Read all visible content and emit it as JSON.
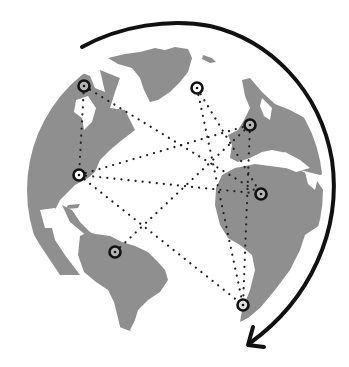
{
  "illustration": {
    "subject": "globe-network-connections",
    "colors": {
      "background": "#ffffff",
      "ocean": "#ffffff",
      "land": "#8f8f8f",
      "marker": "#111111",
      "line": "#222222",
      "arrow": "#111111"
    },
    "markers": [
      {
        "id": "north-america-north",
        "x": 84,
        "y": 86
      },
      {
        "id": "greenland-east",
        "x": 197,
        "y": 88
      },
      {
        "id": "europe",
        "x": 250,
        "y": 125
      },
      {
        "id": "north-america-east",
        "x": 79,
        "y": 175
      },
      {
        "id": "africa-central",
        "x": 261,
        "y": 194
      },
      {
        "id": "south-america",
        "x": 115,
        "y": 252
      },
      {
        "id": "africa-south",
        "x": 243,
        "y": 305
      }
    ],
    "connections": [
      [
        "north-america-north",
        "north-america-east"
      ],
      [
        "north-america-north",
        "africa-central"
      ],
      [
        "greenland-east",
        "africa-south"
      ],
      [
        "greenland-east",
        "africa-central"
      ],
      [
        "north-america-east",
        "europe"
      ],
      [
        "north-america-east",
        "africa-central"
      ],
      [
        "north-america-east",
        "africa-south"
      ],
      [
        "south-america",
        "europe"
      ],
      [
        "europe",
        "africa-south"
      ]
    ],
    "arrow": {
      "direction": "clockwise",
      "start": {
        "x": 82,
        "y": 47
      },
      "end": {
        "x": 248,
        "y": 345
      }
    }
  }
}
